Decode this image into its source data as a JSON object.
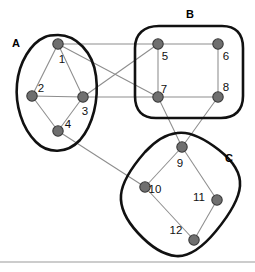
{
  "figure": {
    "width": 255,
    "height": 272,
    "background": "#ffffff",
    "node_color": "#6f6f6f",
    "node_stroke_color": "#3a3a3a",
    "edge_color": "#8d8d8d",
    "cluster_outline_color": "#111111",
    "label_color": "#111111",
    "footer_rule_color": "#9a9a9a"
  },
  "clusters": [
    {
      "id": "A",
      "label": "A",
      "label_x": 16,
      "label_y": 47,
      "member_nodes": [
        1,
        2,
        3,
        4
      ],
      "shape": "blob",
      "path": "M 58 35 C 76 35 93 52 96 76 C 99 100 93 125 80 140 C 67 154 48 154 36 142 C 22 128 15 105 17 84 C 19 62 31 43 45 37 C 49 35 54 35 58 35 Z"
    },
    {
      "id": "B",
      "label": "B",
      "label_x": 190,
      "label_y": 18,
      "member_nodes": [
        5,
        6,
        7,
        8
      ],
      "shape": "rounded-rectangle",
      "path": "M 159 26 L 222 26 C 236 26 243 34 243 48 L 243 96 C 243 110 235 118 221 118 L 156 118 C 142 118 135 110 135 96 L 135 48 C 135 34 144 26 159 26 Z"
    },
    {
      "id": "C",
      "label": "C",
      "label_x": 229,
      "label_y": 162,
      "member_nodes": [
        9,
        10,
        11,
        12
      ],
      "shape": "tilted-rounded-rectangle",
      "path": "M 177 133 C 190 131 205 139 219 150 C 233 161 241 174 240 186 C 239 199 230 214 216 231 C 202 248 188 257 176 256 C 164 255 150 246 138 233 C 126 220 120 207 121 195 C 122 183 131 168 145 152 C 157 139 168 134 177 133 Z"
    }
  ],
  "nodes": [
    {
      "id": 1,
      "label": "1",
      "x": 58,
      "y": 44,
      "label_x": 62,
      "label_y": 63,
      "cluster": "A"
    },
    {
      "id": 2,
      "label": "2",
      "x": 32,
      "y": 96,
      "label_x": 41,
      "label_y": 92,
      "cluster": "A"
    },
    {
      "id": 3,
      "label": "3",
      "x": 83,
      "y": 97,
      "label_x": 85,
      "label_y": 115,
      "cluster": "A"
    },
    {
      "id": 4,
      "label": "4",
      "x": 58,
      "y": 131,
      "label_x": 68,
      "label_y": 128,
      "cluster": "A"
    },
    {
      "id": 5,
      "label": "5",
      "x": 158,
      "y": 44,
      "label_x": 165,
      "label_y": 60,
      "cluster": "B"
    },
    {
      "id": 6,
      "label": "6",
      "x": 218,
      "y": 44,
      "label_x": 226,
      "label_y": 60,
      "cluster": "B"
    },
    {
      "id": 7,
      "label": "7",
      "x": 158,
      "y": 97,
      "label_x": 164,
      "label_y": 93,
      "cluster": "B"
    },
    {
      "id": 8,
      "label": "8",
      "x": 218,
      "y": 97,
      "label_x": 226,
      "label_y": 91,
      "cluster": "B"
    },
    {
      "id": 9,
      "label": "9",
      "x": 182,
      "y": 147,
      "label_x": 180,
      "label_y": 167,
      "cluster": "C"
    },
    {
      "id": 10,
      "label": "10",
      "x": 145,
      "y": 187,
      "label_x": 155,
      "label_y": 193,
      "cluster": "C"
    },
    {
      "id": 11,
      "label": "11",
      "x": 217,
      "y": 200,
      "label_x": 199,
      "label_y": 201,
      "cluster": "C"
    },
    {
      "id": 12,
      "label": "12",
      "x": 194,
      "y": 240,
      "label_x": 176,
      "label_y": 234,
      "cluster": "C"
    }
  ],
  "edges": [
    {
      "from": 1,
      "to": 2,
      "kind": "intra-A"
    },
    {
      "from": 1,
      "to": 3,
      "kind": "intra-A"
    },
    {
      "from": 2,
      "to": 3,
      "kind": "intra-A"
    },
    {
      "from": 2,
      "to": 4,
      "kind": "intra-A"
    },
    {
      "from": 3,
      "to": 4,
      "kind": "intra-A"
    },
    {
      "from": 5,
      "to": 6,
      "kind": "intra-B"
    },
    {
      "from": 5,
      "to": 7,
      "kind": "intra-B"
    },
    {
      "from": 6,
      "to": 8,
      "kind": "intra-B"
    },
    {
      "from": 7,
      "to": 8,
      "kind": "intra-B"
    },
    {
      "from": 9,
      "to": 10,
      "kind": "intra-C"
    },
    {
      "from": 9,
      "to": 11,
      "kind": "intra-C"
    },
    {
      "from": 10,
      "to": 12,
      "kind": "intra-C"
    },
    {
      "from": 11,
      "to": 12,
      "kind": "intra-C"
    },
    {
      "from": 1,
      "to": 5,
      "kind": "inter-AB"
    },
    {
      "from": 1,
      "to": 7,
      "kind": "inter-AB"
    },
    {
      "from": 3,
      "to": 5,
      "kind": "inter-AB"
    },
    {
      "from": 3,
      "to": 7,
      "kind": "inter-AB"
    },
    {
      "from": 7,
      "to": 9,
      "kind": "inter-BC"
    },
    {
      "from": 8,
      "to": 9,
      "kind": "inter-BC"
    },
    {
      "from": 4,
      "to": 10,
      "kind": "inter-AC"
    }
  ],
  "footer_rule": {
    "x1": 0,
    "y1": 262,
    "x2": 255,
    "y2": 262
  }
}
